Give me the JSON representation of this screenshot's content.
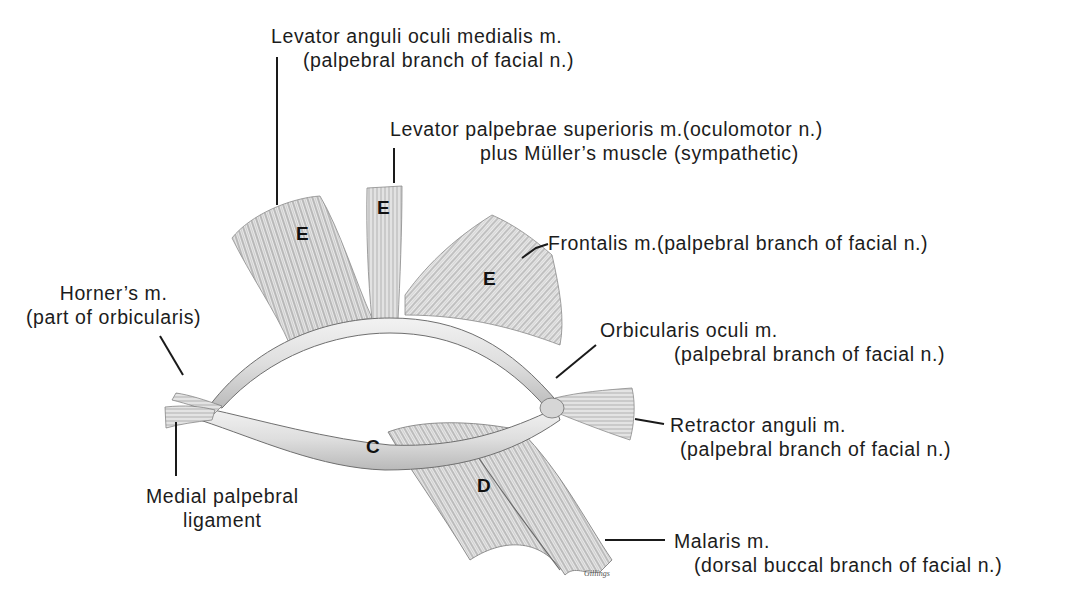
{
  "figure": {
    "type": "anatomical-diagram",
    "region_letters": {
      "C": "C",
      "D": "D",
      "E1": "E",
      "E2": "E",
      "E3": "E"
    },
    "labels": {
      "levator_anguli": {
        "line1": "Levator anguli oculi medialis m.",
        "line2": "(palpebral branch of facial n.)"
      },
      "levator_palpebrae": {
        "line1": "Levator palpebrae superioris m.(oculomotor n.)",
        "line2": "plus Müller’s muscle (sympathetic)"
      },
      "frontalis": {
        "line1": "Frontalis m.(palpebral branch of facial n.)"
      },
      "horners": {
        "line1": "Horner’s m.",
        "line2": "(part of orbicularis)"
      },
      "orbicularis": {
        "line1": "Orbicularis oculi m.",
        "line2": "(palpebral branch of facial n.)"
      },
      "retractor": {
        "line1": "Retractor anguli m.",
        "line2": "(palpebral branch of facial n.)"
      },
      "medial_ligament": {
        "line1": "Medial palpebral",
        "line2": "ligament"
      },
      "malaris": {
        "line1": "Malaris m.",
        "line2": "(dorsal buccal branch of facial n.)"
      }
    },
    "signature": "Gillings",
    "colors": {
      "background": "#ffffff",
      "text": "#1c1c1c",
      "leader_line": "#1a1a1a",
      "muscle_light": "#e6e6e6",
      "muscle_mid": "#a8a8a8",
      "muscle_dark": "#5a5a5a"
    }
  }
}
